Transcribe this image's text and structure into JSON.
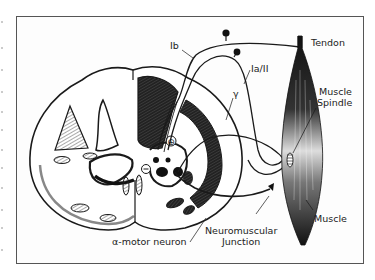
{
  "figure": {
    "labels": {
      "ib": "Ib",
      "ia_ii": "Ia/II",
      "gamma": "γ",
      "tendon": "Tendon",
      "muscle_spindle_line1": "Muscle",
      "muscle_spindle_line2": "Spindle",
      "muscle": "Muscle",
      "nmj_line1": "Neuromuscular",
      "nmj_line2": "Junction",
      "alpha_motor_neuron": "α-motor neuron",
      "excitatory_symbol": "⊕",
      "inhibitory_symbol": "⊖"
    },
    "colors": {
      "ink": "#1a1a1a",
      "frame": "#555555",
      "hatch": "#777777",
      "background": "#ffffff"
    }
  }
}
